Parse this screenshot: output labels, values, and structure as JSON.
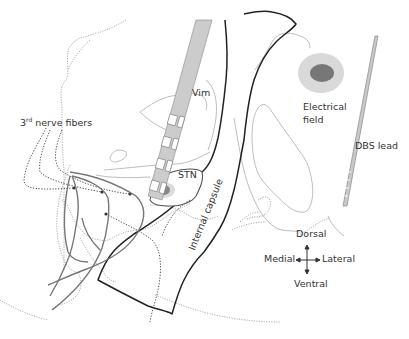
{
  "labels": {
    "nerve_prefix": "3",
    "nerve_sup": "rd",
    "nerve_suffix": " nerve fibers",
    "vim": "Vim",
    "stn": "STN",
    "internal_capsule": "Internal capsule",
    "electrical_field_line1": "Electrical",
    "electrical_field_line2": "field",
    "dbs_lead": "DBS lead"
  },
  "orientation": {
    "dorsal": "Dorsal",
    "ventral": "Ventral",
    "medial": "Medial",
    "lateral": "Lateral"
  },
  "colors": {
    "lead_fill": "#c8c8c8",
    "lead_contact_fill": "#ffffff",
    "capsule_stroke": "#222222",
    "field_outer": "#d6d6d6",
    "field_inner": "#777777",
    "fiber_stroke": "#666666",
    "outline_light": "#bbbbbb"
  }
}
